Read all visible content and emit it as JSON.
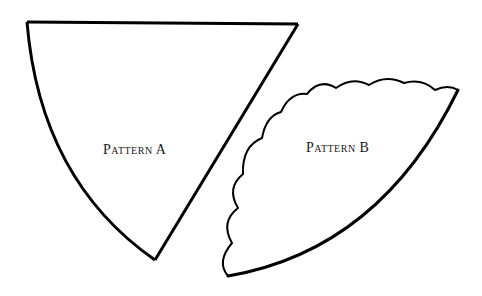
{
  "figure": {
    "background": "#ffffff",
    "stroke_color": "#000000",
    "patterns": [
      {
        "id": "A",
        "label": "Pattern A",
        "edge_style": "plain",
        "shape": "cone sector with curved outer edge"
      },
      {
        "id": "B",
        "label": "Pattern B",
        "edge_style": "scalloped",
        "shape": "cone sector with scalloped outer edge"
      }
    ]
  }
}
